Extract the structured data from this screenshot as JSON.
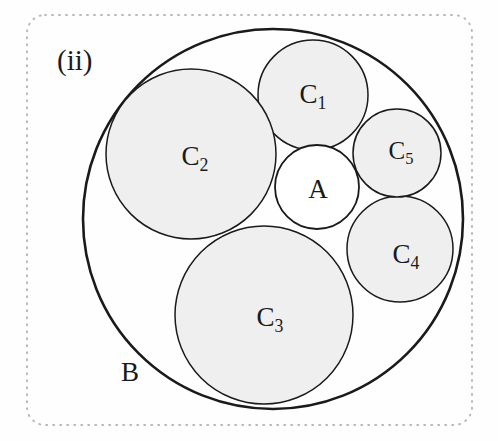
{
  "figure": {
    "panel_label": "(ii)",
    "caption_label_position": {
      "x": 57,
      "y": 63
    },
    "background_color": "#fefefe",
    "border": {
      "style": "dotted",
      "color": "#b9b9b9",
      "width": 2,
      "corner_radius": 18,
      "rect": {
        "x": 27,
        "y": 15,
        "w": 445,
        "h": 410
      }
    },
    "stroke_color": "#1a1a1a",
    "fill_color": "#efefef",
    "outer_stroke_width": 2.6,
    "inner_stroke_width": 1.5
  },
  "chart_data": {
    "type": "diagram",
    "title": "(ii)",
    "subtitle": "",
    "xlabel": "",
    "ylabel": "",
    "coordinate_space": {
      "width": 498,
      "height": 441,
      "units": "pixels"
    },
    "legend_position": "none",
    "grid": false,
    "circles": [
      {
        "id": "B",
        "label": "B",
        "cx": 273,
        "cy": 219,
        "r": 190,
        "fill": "none",
        "filled": false,
        "stroke": "#1a1a1a",
        "stroke_width": 2.6,
        "role": "outer-bounding-circle",
        "label_x": 130,
        "label_y": 375,
        "label_font_size": 27,
        "label_inside": false,
        "subscript": ""
      },
      {
        "id": "C1",
        "label": "C",
        "subscript": "1",
        "cx": 313,
        "cy": 95,
        "r": 55,
        "fill": "#efefef",
        "filled": true,
        "stroke": "#1a1a1a",
        "stroke_width": 1.5,
        "role": "tangent-circle",
        "label_x": 313,
        "label_y": 97,
        "label_font_size": 27,
        "label_inside": true
      },
      {
        "id": "C2",
        "label": "C",
        "subscript": "2",
        "cx": 191,
        "cy": 154,
        "r": 85,
        "fill": "#efefef",
        "filled": true,
        "stroke": "#1a1a1a",
        "stroke_width": 1.5,
        "role": "tangent-circle",
        "label_x": 195,
        "label_y": 159,
        "label_font_size": 27,
        "label_inside": true
      },
      {
        "id": "C3",
        "label": "C",
        "subscript": "3",
        "cx": 264,
        "cy": 315,
        "r": 89,
        "fill": "#efefef",
        "filled": true,
        "stroke": "#1a1a1a",
        "stroke_width": 1.5,
        "role": "tangent-circle",
        "label_x": 270,
        "label_y": 320,
        "label_font_size": 27,
        "label_inside": true
      },
      {
        "id": "C4",
        "label": "C",
        "subscript": "4",
        "cx": 400,
        "cy": 249,
        "r": 53,
        "fill": "#efefef",
        "filled": true,
        "stroke": "#1a1a1a",
        "stroke_width": 1.5,
        "role": "tangent-circle",
        "label_x": 406,
        "label_y": 257,
        "label_font_size": 27,
        "label_inside": true
      },
      {
        "id": "C5",
        "label": "C",
        "subscript": "5",
        "cx": 397,
        "cy": 153,
        "r": 44,
        "fill": "#efefef",
        "filled": true,
        "stroke": "#1a1a1a",
        "stroke_width": 1.5,
        "role": "tangent-circle",
        "label_x": 401,
        "label_y": 153,
        "label_font_size": 25,
        "label_inside": true
      },
      {
        "id": "A",
        "label": "A",
        "subscript": "",
        "cx": 317,
        "cy": 187,
        "r": 42,
        "fill": "#ffffff",
        "filled": false,
        "stroke": "#1a1a1a",
        "stroke_width": 1.8,
        "role": "central-inner-circle",
        "label_x": 318,
        "label_y": 192,
        "label_font_size": 27,
        "label_inside": true
      }
    ]
  }
}
